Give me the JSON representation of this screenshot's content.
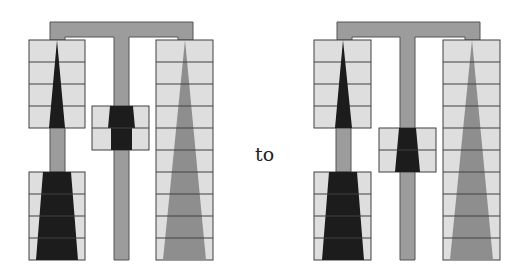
{
  "connector_label": "to",
  "colors": {
    "cell_fill": "#dedede",
    "grid_line": "#404040",
    "frame_fill": "#9c9c9c",
    "dark_fill": "#1c1c1c",
    "mid_fill": "#8e8e8e",
    "background": "#ffffff"
  },
  "figures": [
    {
      "name": "before",
      "left_top_block_rows": 4,
      "left_bottom_block_rows": 4,
      "middle_block_rows": 2,
      "right_column_rows": 10,
      "middle_block_position": "upper"
    },
    {
      "name": "after",
      "left_top_block_rows": 4,
      "left_bottom_block_rows": 4,
      "middle_block_rows": 2,
      "right_column_rows": 10,
      "middle_block_position": "lower"
    }
  ]
}
